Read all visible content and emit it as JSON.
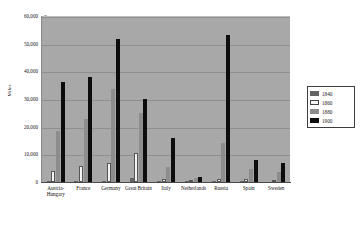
{
  "chart_data": {
    "type": "bar",
    "title": "",
    "xlabel": "",
    "ylabel": "Miles",
    "ylim": [
      0,
      60000
    ],
    "ytick_labels": [
      "0",
      "10,000",
      "20,000",
      "30,000",
      "40,000",
      "50,000",
      "60,000"
    ],
    "ytick_values": [
      0,
      10000,
      20000,
      30000,
      40000,
      50000,
      60000
    ],
    "grid": true,
    "legend_position": "right",
    "categories": [
      "Austria-Hungary",
      "France",
      "Germany",
      "Great Britain",
      "Italy",
      "Netherlands",
      "Russia",
      "Spain",
      "Sweden"
    ],
    "series": [
      {
        "name": "1840",
        "color": "#636363",
        "values": [
          90,
          300,
          340,
          1350,
          130,
          10,
          200,
          20,
          0
        ]
      },
      {
        "name": "1860",
        "color": "#f4f4f4",
        "values": [
          4000,
          5800,
          6900,
          10400,
          1100,
          210,
          1000,
          1200,
          380
        ]
      },
      {
        "name": "1880",
        "color": "#8d8d8d",
        "values": [
          18500,
          22600,
          33800,
          25100,
          5400,
          1500,
          14000,
          4800,
          3700
        ]
      },
      {
        "name": "1900",
        "color": "#0d0d0d",
        "values": [
          36300,
          38000,
          51700,
          30100,
          16000,
          1700,
          53200,
          8000,
          7000
        ]
      }
    ]
  },
  "legend": {
    "entries": [
      {
        "label": "1840"
      },
      {
        "label": "1860"
      },
      {
        "label": "1880"
      },
      {
        "label": "1900"
      }
    ]
  }
}
